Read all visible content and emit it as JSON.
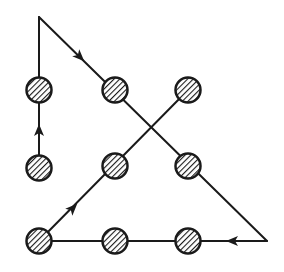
{
  "diagram": {
    "title": "",
    "type": "nine-dots-puzzle-solution",
    "colors": {
      "ink": "#1a1a1a",
      "background": "#ffffff"
    },
    "dots": [
      {
        "row": 1,
        "col": 1,
        "x": 39,
        "y": 90
      },
      {
        "row": 1,
        "col": 2,
        "x": 115,
        "y": 90
      },
      {
        "row": 1,
        "col": 3,
        "x": 188,
        "y": 90
      },
      {
        "row": 2,
        "col": 1,
        "x": 39,
        "y": 168
      },
      {
        "row": 2,
        "col": 2,
        "x": 115,
        "y": 166
      },
      {
        "row": 2,
        "col": 3,
        "x": 188,
        "y": 166
      },
      {
        "row": 3,
        "col": 1,
        "x": 39,
        "y": 241
      },
      {
        "row": 3,
        "col": 2,
        "x": 115,
        "y": 241
      },
      {
        "row": 3,
        "col": 3,
        "x": 188,
        "y": 241
      }
    ],
    "path": [
      {
        "from": [
          39,
          168
        ],
        "to": [
          39,
          17
        ],
        "arrow_at": [
          39,
          130
        ],
        "direction": "up"
      },
      {
        "from": [
          39,
          17
        ],
        "to": [
          267,
          241
        ],
        "arrow_at": [
          80,
          57
        ],
        "direction": "down-right"
      },
      {
        "from": [
          267,
          241
        ],
        "to": [
          39,
          241
        ],
        "arrow_at": [
          232,
          241
        ],
        "direction": "left"
      },
      {
        "from": [
          39,
          241
        ],
        "to": [
          188,
          90
        ],
        "arrow_at": [
          73,
          208
        ],
        "direction": "up-right"
      }
    ]
  }
}
